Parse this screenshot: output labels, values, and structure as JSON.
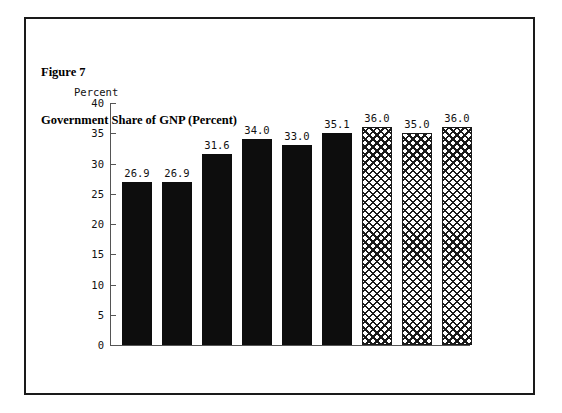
{
  "figure": {
    "caption_line1": "Figure 7",
    "caption_line2": "Government Share of GNP (Percent)"
  },
  "chart_data": {
    "type": "bar",
    "title": "Government Share of GNP (Percent)",
    "xlabel": "Year",
    "ylabel": "Percent",
    "categories": [
      "1960",
      "1965",
      "1970",
      "1975",
      "1980",
      "1985",
      "1990",
      "1995",
      "2000"
    ],
    "values": [
      26.9,
      26.9,
      31.6,
      34.0,
      33.0,
      35.1,
      36.0,
      35.0,
      36.0
    ],
    "value_labels": [
      "26.9",
      "26.9",
      "31.6",
      "34.0",
      "33.0",
      "35.1",
      "36.0",
      "35.0",
      "36.0"
    ],
    "bar_styles": [
      "solid",
      "solid",
      "solid",
      "solid",
      "solid",
      "solid",
      "hatch",
      "hatch",
      "hatch"
    ],
    "ylim": [
      0,
      40
    ],
    "yticks": [
      0,
      5,
      10,
      15,
      20,
      25,
      30,
      35,
      40
    ],
    "ytick_labels": [
      "0",
      "5",
      "10",
      "15",
      "20",
      "25",
      "30",
      "35",
      "40"
    ],
    "grid": false,
    "legend": "none",
    "colors": {
      "solid_bar": "#0d0d0d",
      "hatch_bar_outline": "#1a1a1a",
      "axis": "#555555",
      "text": "#111111",
      "frame": "#1a1a1a",
      "background": "#ffffff"
    }
  }
}
